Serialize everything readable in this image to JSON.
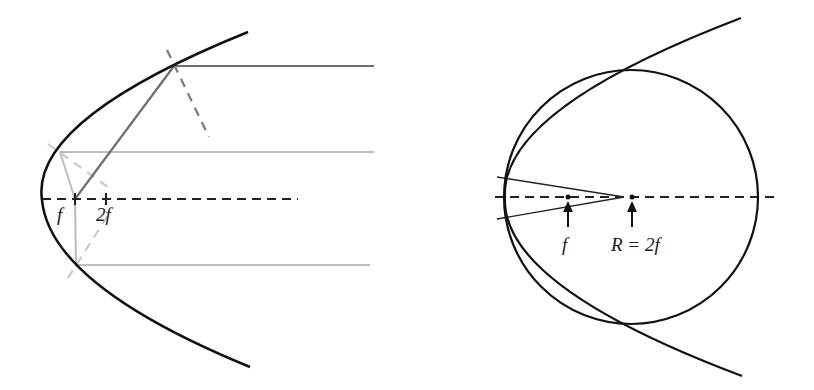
{
  "figure": {
    "panels": [
      {
        "id": "left",
        "description": "Parabolic mirror reflecting parallel rays to focus; normals shown dashed",
        "labels": {
          "focus": "f",
          "double_focus_num": "2",
          "double_focus_var": "f"
        }
      },
      {
        "id": "right",
        "description": "Parabola compared with osculating circle of radius R = 2f",
        "labels": {
          "focus": "f",
          "radius_R": "R",
          "equals": " = ",
          "radius_num": "2",
          "radius_var": "f"
        }
      }
    ],
    "colors": {
      "curve": "#111111",
      "axis": "#222222",
      "dark_ray": "#6e6e6e",
      "light_ray": "#bdbdbd",
      "dark_normal": "#7a7a7a",
      "light_normal": "#c8c8c8",
      "background": "#ffffff"
    }
  }
}
